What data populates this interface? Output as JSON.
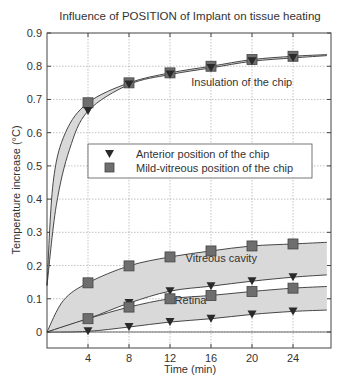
{
  "chart_data": {
    "type": "line",
    "title": "Influence of POSITION of Implant on tissue heating",
    "xlabel": "Time (min)",
    "ylabel": "Temperature increase (°C)",
    "xlim": [
      0,
      27.5
    ],
    "ylim": [
      -0.05,
      0.9
    ],
    "x_ticks": [
      4,
      8,
      12,
      16,
      20,
      24
    ],
    "y_ticks": [
      0,
      0.1,
      0.2,
      0.3,
      0.4,
      0.5,
      0.6,
      0.7,
      0.8,
      0.9
    ],
    "y_tick_labels": [
      "0",
      "0.1",
      "0.2",
      "0.3",
      "0.4",
      "0.5",
      "0.6",
      "0.7",
      "0.8",
      "0.9"
    ],
    "grid": true,
    "legend": {
      "position": "center",
      "entries": [
        {
          "label": "Anterior position of the chip",
          "marker": "triangle-down"
        },
        {
          "label": "Mild-vitreous position of the chip",
          "marker": "square"
        }
      ]
    },
    "x": [
      4,
      8,
      12,
      16,
      20,
      24
    ],
    "series": [
      {
        "name": "Insulation of the chip - Mild-vitreous",
        "marker": "square",
        "group": "Insulation of the chip",
        "values": [
          0.69,
          0.75,
          0.78,
          0.8,
          0.82,
          0.83
        ]
      },
      {
        "name": "Insulation of the chip - Anterior",
        "marker": "triangle-down",
        "group": "Insulation of the chip",
        "values": [
          0.665,
          0.745,
          0.775,
          0.795,
          0.815,
          0.825
        ]
      },
      {
        "name": "Vitreous cavity - Mild-vitreous",
        "marker": "square",
        "group": "Vitreous cavity",
        "values": [
          0.148,
          0.199,
          0.226,
          0.244,
          0.259,
          0.265
        ]
      },
      {
        "name": "Vitreous cavity - Anterior",
        "marker": "triangle-down",
        "group": "Vitreous cavity",
        "values": [
          0.04,
          0.087,
          0.123,
          0.138,
          0.153,
          0.165
        ]
      },
      {
        "name": "Retina - Mild-vitreous",
        "marker": "square",
        "group": "Retina",
        "values": [
          0.04,
          0.075,
          0.1,
          0.11,
          0.122,
          0.132
        ]
      },
      {
        "name": "Retina - Anterior",
        "marker": "triangle-down",
        "group": "Retina",
        "values": [
          0.002,
          0.015,
          0.03,
          0.04,
          0.053,
          0.062
        ]
      }
    ],
    "annotations": [
      {
        "text": "Insulation of the chip",
        "x": 19,
        "y": 0.74
      },
      {
        "text": "Vitreous cavity",
        "x": 17,
        "y": 0.21
      },
      {
        "text": "Retina",
        "x": 14,
        "y": 0.085
      }
    ]
  },
  "colors": {
    "axis": "#444444",
    "grid": "#9a9a9a",
    "line": "#333333",
    "band": "#d9d9d9",
    "marker": "#6e6e6e",
    "triangle": "#2a2a2a"
  }
}
